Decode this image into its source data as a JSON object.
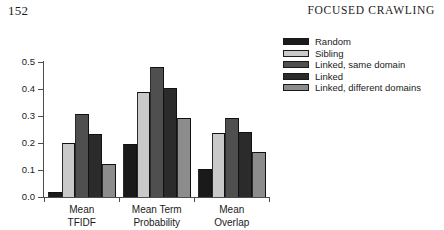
{
  "page": {
    "folio": "152",
    "running_head": "FOCUSED CRAWLING"
  },
  "chart_data": {
    "type": "bar",
    "title": "",
    "xlabel": "",
    "ylabel": "",
    "ylim": [
      0.0,
      0.5
    ],
    "yticks": [
      "0.0",
      "0.1",
      "0.2",
      "0.3",
      "0.4",
      "0.5"
    ],
    "ytick_values": [
      0.0,
      0.1,
      0.2,
      0.3,
      0.4,
      0.5
    ],
    "grid": false,
    "legend_position": "right",
    "categories": [
      "Mean TFIDF",
      "Mean Term Probability",
      "Mean Overlap"
    ],
    "category_lines": [
      [
        "Mean",
        "TFIDF"
      ],
      [
        "Mean Term",
        "Probability"
      ],
      [
        "Mean",
        "Overlap"
      ]
    ],
    "series": [
      {
        "name": "Random",
        "color": "#1a1a1a",
        "values": [
          0.02,
          0.195,
          0.105
        ]
      },
      {
        "name": "Sibling",
        "color": "#c9c9c9",
        "values": [
          0.2,
          0.39,
          0.238
        ]
      },
      {
        "name": "Linked, same domain",
        "color": "#4f4f4f",
        "values": [
          0.308,
          0.48,
          0.292
        ]
      },
      {
        "name": "Linked",
        "color": "#2b2b2b",
        "values": [
          0.232,
          0.405,
          0.241
        ]
      },
      {
        "name": "Linked, different domains",
        "color": "#8c8c8c",
        "values": [
          0.121,
          0.292,
          0.165
        ]
      }
    ]
  }
}
